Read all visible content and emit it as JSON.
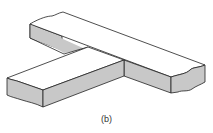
{
  "figure": {
    "caption": "(b)",
    "colors": {
      "face": "#ffffff",
      "side": "#c8c8c8",
      "line": "#222222"
    }
  }
}
